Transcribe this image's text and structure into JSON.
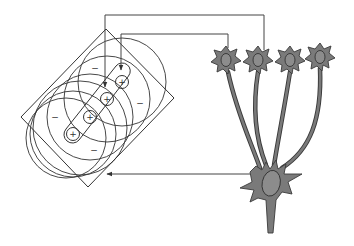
{
  "figure": {
    "description": "Simple cell receptive field formed by convergence of aligned center-surround inputs",
    "receptive_field": {
      "frame": {
        "corners": [
          [
            106,
            29
          ],
          [
            174,
            98
          ],
          [
            88,
            187
          ],
          [
            21,
            117
          ]
        ]
      },
      "centers": [
        {
          "label": "+",
          "x": 122,
          "y": 82
        },
        {
          "label": "+",
          "x": 107,
          "y": 99
        },
        {
          "label": "+",
          "x": 90,
          "y": 117
        },
        {
          "label": "+",
          "x": 73,
          "y": 134
        }
      ],
      "surround_signs": [
        {
          "label": "−",
          "x": 95,
          "y": 68
        },
        {
          "label": "−",
          "x": 140,
          "y": 103
        },
        {
          "label": "−",
          "x": 55,
          "y": 117
        },
        {
          "label": "−",
          "x": 94,
          "y": 150
        }
      ],
      "surround_radius": 43
    },
    "input_neurons": [
      {
        "name": "input-neuron-1",
        "x": 226,
        "y": 60
      },
      {
        "name": "input-neuron-2",
        "x": 258,
        "y": 60
      },
      {
        "name": "input-neuron-3",
        "x": 290,
        "y": 60
      },
      {
        "name": "input-neuron-4",
        "x": 320,
        "y": 57
      }
    ],
    "output_neuron": {
      "x": 270,
      "y": 184
    },
    "connections": {
      "outer_line": "to receptive field center 2",
      "inner_line": "to receptive field center 1",
      "return_line": "output neuron to receptive field"
    },
    "colors": {
      "neuron_fill": "#7a7a7a",
      "neuron_stroke": "#3a3a3a",
      "line": "#444444",
      "nucleus": "#8c8c8c"
    }
  }
}
